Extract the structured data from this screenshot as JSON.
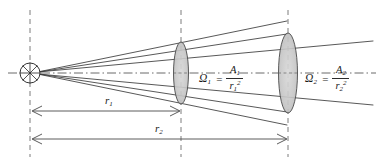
{
  "figure": {
    "type": "geometric-optics-diagram",
    "canvas": {
      "width": 382,
      "height": 165,
      "background": "#ffffff"
    }
  },
  "colors": {
    "line": "#3a3a3a",
    "dash": "#6e6e6e",
    "axis": "#555555",
    "ellipse_fill": "#c9c9c9",
    "ellipse_stroke": "#4a4a4a",
    "text": "#1a1a1a",
    "source_stroke": "#333333"
  },
  "source": {
    "name": "point-source",
    "cx": 30,
    "cy": 73,
    "radius": 10,
    "spokes": 8
  },
  "axis": {
    "name": "optical-axis",
    "y": 73,
    "x_start": 8,
    "x_end": 376,
    "style": "dash-dot"
  },
  "vertical_guides": [
    {
      "name": "guide-source",
      "x": 30,
      "y_top": 10,
      "y_bottom": 157
    },
    {
      "name": "guide-surface-1",
      "x": 181,
      "y_top": 10,
      "y_bottom": 157
    },
    {
      "name": "guide-surface-2",
      "x": 288,
      "y_top": 10,
      "y_bottom": 157
    }
  ],
  "surfaces": [
    {
      "name": "area-element-1",
      "label": "A1",
      "cx": 181,
      "cy": 73,
      "rx": 7.5,
      "ry": 31
    },
    {
      "name": "area-element-2",
      "label": "A2",
      "cx": 288,
      "cy": 73,
      "rx": 9.5,
      "ry": 40
    }
  ],
  "cone_lines": [
    {
      "name": "inner-cone-upper",
      "x1": 38,
      "y1": 71,
      "x2": 287,
      "y2": 34
    },
    {
      "name": "inner-cone-lower",
      "x1": 38,
      "y1": 75,
      "x2": 287,
      "y2": 112
    },
    {
      "name": "outer-cone-upper",
      "x1": 38,
      "y1": 71,
      "x2": 373,
      "y2": 41
    },
    {
      "name": "outer-cone-lower",
      "x1": 38,
      "y1": 75,
      "x2": 373,
      "y2": 105
    },
    {
      "name": "mid-cone-upper",
      "x1": 38,
      "y1": 71,
      "x2": 287,
      "y2": 21
    },
    {
      "name": "mid-cone-lower",
      "x1": 38,
      "y1": 75,
      "x2": 287,
      "y2": 125
    }
  ],
  "formulas": [
    {
      "name": "solid-angle-1",
      "symbol": "Ω",
      "symbol_sub": "1",
      "equals": "=",
      "numerator": "A",
      "numerator_sub": "1",
      "denominator": "r",
      "denominator_sub": "1",
      "denominator_sup": "2",
      "x": 200,
      "y": 73
    },
    {
      "name": "solid-angle-2",
      "symbol": "Ω",
      "symbol_sub": "2",
      "equals": "=",
      "numerator": "A",
      "numerator_sub": "2",
      "denominator": "r",
      "denominator_sub": "2",
      "denominator_sup": "2",
      "x": 306,
      "y": 73
    }
  ],
  "dimensions": [
    {
      "name": "distance-r1",
      "label": "r",
      "label_sub": "1",
      "x_start": 31,
      "x_end": 181,
      "y": 111,
      "label_x": 108,
      "label_y": 96
    },
    {
      "name": "distance-r2",
      "label": "r",
      "label_sub": "2",
      "x_start": 31,
      "x_end": 288,
      "y": 139,
      "label_x": 158,
      "label_y": 124
    }
  ]
}
